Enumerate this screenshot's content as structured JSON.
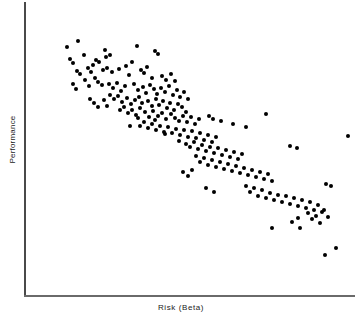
{
  "figure": {
    "width": 362,
    "height": 316,
    "background_color": "#ffffff",
    "point_color": "#000000",
    "axis_color": "#4a4a4a"
  },
  "chart_data": {
    "type": "scatter",
    "title": "",
    "subtitle": "",
    "xlabel": "Risk  (Beta)",
    "ylabel": "Performance",
    "grid": false,
    "legend": null,
    "xticks": [],
    "yticks": [],
    "xtick_labels": [],
    "ytick_labels": [],
    "axis_style": "left-and-bottom-spine-only",
    "xlim": [
      0,
      1
    ],
    "ylim": [
      0,
      1
    ],
    "correlation": "negative",
    "n_points": 203,
    "marker": "filled-circle",
    "marker_size_px": 4,
    "note": "points given in figure pixel coordinates (x right, y down) of a 362x316 canvas; plot box spans x 24-355, y 2-295",
    "points_px": [
      [
        78,
        41
      ],
      [
        67,
        47
      ],
      [
        84,
        55
      ],
      [
        70,
        59
      ],
      [
        73,
        63
      ],
      [
        105,
        50
      ],
      [
        106,
        57
      ],
      [
        110,
        55
      ],
      [
        137,
        46
      ],
      [
        155,
        51
      ],
      [
        158,
        54
      ],
      [
        96,
        60
      ],
      [
        99,
        62
      ],
      [
        93,
        65
      ],
      [
        132,
        62
      ],
      [
        88,
        68
      ],
      [
        91,
        72
      ],
      [
        77,
        71
      ],
      [
        80,
        74
      ],
      [
        103,
        70
      ],
      [
        107,
        68
      ],
      [
        112,
        72
      ],
      [
        119,
        69
      ],
      [
        126,
        66
      ],
      [
        129,
        75
      ],
      [
        141,
        70
      ],
      [
        144,
        73
      ],
      [
        147,
        67
      ],
      [
        152,
        78
      ],
      [
        162,
        76
      ],
      [
        166,
        80
      ],
      [
        171,
        74
      ],
      [
        175,
        81
      ],
      [
        95,
        78
      ],
      [
        98,
        82
      ],
      [
        102,
        85
      ],
      [
        85,
        80
      ],
      [
        89,
        86
      ],
      [
        73,
        84
      ],
      [
        76,
        89
      ],
      [
        109,
        84
      ],
      [
        113,
        88
      ],
      [
        117,
        83
      ],
      [
        121,
        91
      ],
      [
        125,
        86
      ],
      [
        134,
        84
      ],
      [
        138,
        90
      ],
      [
        143,
        87
      ],
      [
        146,
        93
      ],
      [
        150,
        85
      ],
      [
        154,
        89
      ],
      [
        157,
        94
      ],
      [
        161,
        88
      ],
      [
        165,
        92
      ],
      [
        169,
        86
      ],
      [
        173,
        95
      ],
      [
        177,
        90
      ],
      [
        180,
        97
      ],
      [
        184,
        92
      ],
      [
        188,
        99
      ],
      [
        110,
        95
      ],
      [
        114,
        99
      ],
      [
        118,
        96
      ],
      [
        122,
        102
      ],
      [
        127,
        98
      ],
      [
        131,
        104
      ],
      [
        135,
        100
      ],
      [
        139,
        97
      ],
      [
        142,
        103
      ],
      [
        148,
        101
      ],
      [
        152,
        106
      ],
      [
        156,
        99
      ],
      [
        159,
        105
      ],
      [
        163,
        101
      ],
      [
        167,
        108
      ],
      [
        170,
        103
      ],
      [
        174,
        110
      ],
      [
        178,
        104
      ],
      [
        182,
        107
      ],
      [
        186,
        112
      ],
      [
        90,
        99
      ],
      [
        94,
        103
      ],
      [
        98,
        107
      ],
      [
        104,
        100
      ],
      [
        107,
        106
      ],
      [
        120,
        110
      ],
      [
        124,
        107
      ],
      [
        128,
        113
      ],
      [
        132,
        110
      ],
      [
        136,
        115
      ],
      [
        140,
        108
      ],
      [
        145,
        112
      ],
      [
        149,
        117
      ],
      [
        153,
        111
      ],
      [
        158,
        116
      ],
      [
        162,
        113
      ],
      [
        166,
        119
      ],
      [
        171,
        114
      ],
      [
        175,
        118
      ],
      [
        179,
        121
      ],
      [
        183,
        116
      ],
      [
        187,
        122
      ],
      [
        191,
        117
      ],
      [
        195,
        124
      ],
      [
        199,
        119
      ],
      [
        140,
        126
      ],
      [
        144,
        122
      ],
      [
        148,
        128
      ],
      [
        152,
        124
      ],
      [
        156,
        130
      ],
      [
        160,
        126
      ],
      [
        164,
        132
      ],
      [
        168,
        127
      ],
      [
        172,
        133
      ],
      [
        176,
        129
      ],
      [
        180,
        135
      ],
      [
        184,
        130
      ],
      [
        188,
        137
      ],
      [
        192,
        131
      ],
      [
        196,
        138
      ],
      [
        200,
        133
      ],
      [
        204,
        140
      ],
      [
        208,
        135
      ],
      [
        212,
        142
      ],
      [
        216,
        137
      ],
      [
        130,
        126
      ],
      [
        138,
        118
      ],
      [
        155,
        120
      ],
      [
        165,
        134
      ],
      [
        179,
        141
      ],
      [
        186,
        144
      ],
      [
        190,
        147
      ],
      [
        194,
        142
      ],
      [
        198,
        149
      ],
      [
        202,
        145
      ],
      [
        206,
        151
      ],
      [
        210,
        147
      ],
      [
        214,
        153
      ],
      [
        218,
        148
      ],
      [
        222,
        155
      ],
      [
        226,
        150
      ],
      [
        230,
        157
      ],
      [
        234,
        152
      ],
      [
        238,
        159
      ],
      [
        242,
        154
      ],
      [
        209,
        116
      ],
      [
        213,
        119
      ],
      [
        221,
        121
      ],
      [
        233,
        124
      ],
      [
        246,
        127
      ],
      [
        196,
        156
      ],
      [
        200,
        162
      ],
      [
        204,
        158
      ],
      [
        208,
        165
      ],
      [
        212,
        160
      ],
      [
        216,
        167
      ],
      [
        220,
        162
      ],
      [
        224,
        169
      ],
      [
        228,
        164
      ],
      [
        232,
        171
      ],
      [
        236,
        166
      ],
      [
        240,
        173
      ],
      [
        244,
        168
      ],
      [
        248,
        175
      ],
      [
        252,
        170
      ],
      [
        256,
        177
      ],
      [
        260,
        172
      ],
      [
        264,
        179
      ],
      [
        268,
        174
      ],
      [
        272,
        181
      ],
      [
        183,
        172
      ],
      [
        188,
        176
      ],
      [
        192,
        170
      ],
      [
        206,
        188
      ],
      [
        214,
        192
      ],
      [
        246,
        186
      ],
      [
        250,
        192
      ],
      [
        254,
        188
      ],
      [
        258,
        196
      ],
      [
        262,
        190
      ],
      [
        266,
        198
      ],
      [
        270,
        193
      ],
      [
        274,
        200
      ],
      [
        278,
        195
      ],
      [
        282,
        202
      ],
      [
        286,
        196
      ],
      [
        290,
        204
      ],
      [
        294,
        198
      ],
      [
        298,
        206
      ],
      [
        302,
        200
      ],
      [
        306,
        208
      ],
      [
        310,
        202
      ],
      [
        314,
        210
      ],
      [
        318,
        205
      ],
      [
        322,
        212
      ],
      [
        266,
        114
      ],
      [
        290,
        146
      ],
      [
        297,
        148
      ],
      [
        326,
        184
      ],
      [
        331,
        186
      ],
      [
        272,
        228
      ],
      [
        292,
        222
      ],
      [
        298,
        218
      ],
      [
        300,
        228
      ],
      [
        308,
        213
      ],
      [
        312,
        219
      ],
      [
        316,
        216
      ],
      [
        320,
        223
      ],
      [
        324,
        210
      ],
      [
        328,
        217
      ],
      [
        336,
        248
      ],
      [
        325,
        255
      ],
      [
        348,
        136
      ]
    ]
  },
  "icons": {
    "x_axis_line": "horizontal-axis-line",
    "y_axis_line": "vertical-axis-line"
  }
}
